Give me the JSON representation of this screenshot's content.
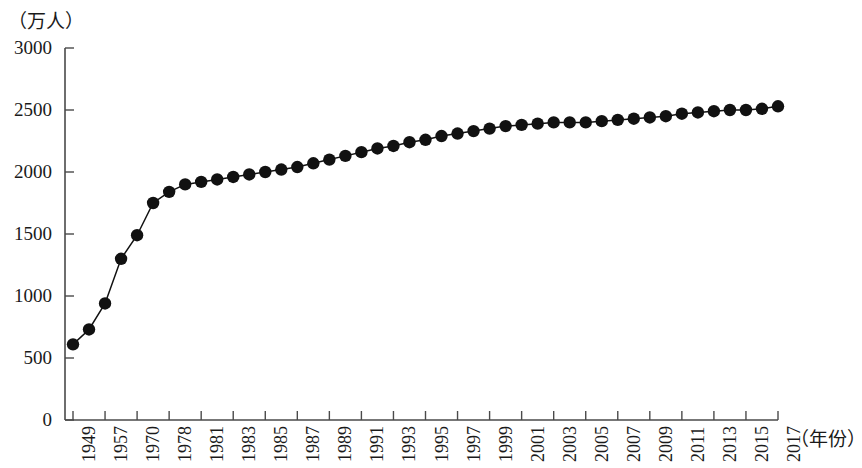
{
  "chart_data": {
    "type": "line",
    "title": "",
    "subtitle": "",
    "ylabel": "（万人）",
    "xlabel": "（年份）",
    "ylim": [
      0,
      3000
    ],
    "ytick_values": [
      0,
      500,
      1000,
      1500,
      2000,
      2500,
      3000
    ],
    "ytick_labels": [
      "0",
      "500",
      "1000",
      "1500",
      "2000",
      "2500",
      "3000"
    ],
    "xtick_labels": [
      "1949",
      "1957",
      "1970",
      "1978",
      "1981",
      "1983",
      "1985",
      "1987",
      "1989",
      "1991",
      "1993",
      "1995",
      "1997",
      "1999",
      "2001",
      "2003",
      "2005",
      "2007",
      "2009",
      "2011",
      "2013",
      "2015",
      "2017"
    ],
    "grid": false,
    "legend": "none",
    "marker": "filled-circle",
    "series": [
      {
        "name": "人口",
        "x": [
          1949,
          1953,
          1957,
          1962,
          1970,
          1975,
          1978,
          1980,
          1981,
          1982,
          1983,
          1984,
          1985,
          1986,
          1987,
          1988,
          1989,
          1990,
          1991,
          1992,
          1993,
          1994,
          1995,
          1996,
          1997,
          1998,
          1999,
          2000,
          2001,
          2002,
          2003,
          2004,
          2005,
          2006,
          2007,
          2008,
          2009,
          2010,
          2011,
          2012,
          2013,
          2014,
          2015,
          2016,
          2017
        ],
        "values": [
          610,
          730,
          940,
          1300,
          1490,
          1750,
          1840,
          1900,
          1920,
          1940,
          1960,
          1980,
          2000,
          2020,
          2040,
          2070,
          2100,
          2130,
          2160,
          2190,
          2210,
          2240,
          2260,
          2290,
          2310,
          2330,
          2350,
          2370,
          2380,
          2390,
          2400,
          2400,
          2400,
          2410,
          2420,
          2430,
          2440,
          2450,
          2470,
          2480,
          2490,
          2500,
          2500,
          2510,
          2530
        ]
      }
    ]
  },
  "axis": {
    "color": "#4a4a4a"
  }
}
